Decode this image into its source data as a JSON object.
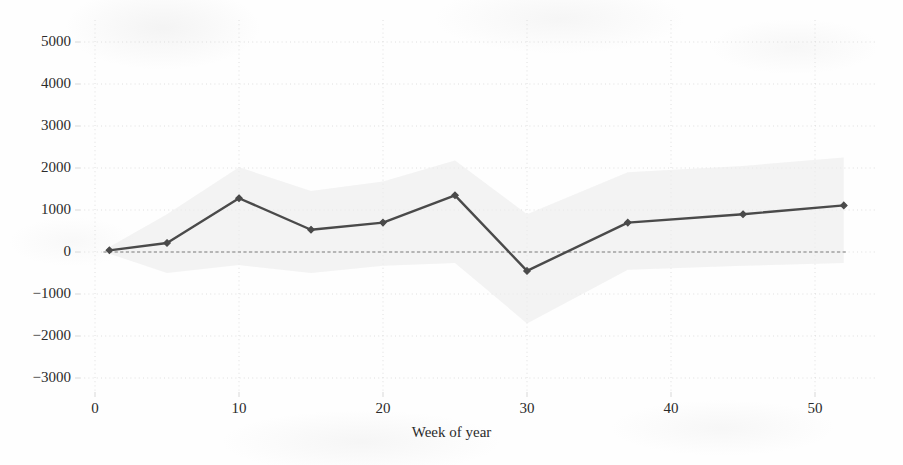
{
  "figure": {
    "background_color": "#fefefe",
    "ink_color": "#2b2b2b",
    "line_color": "#4a4a4a",
    "band_color": "#ededed",
    "grid_color": "#d8d8d8",
    "zero_line_color": "#7a7a7a"
  },
  "chart_data": {
    "type": "line",
    "title": "",
    "subtitle": "",
    "xlabel": "Week of year",
    "ylabel": "",
    "xlim": [
      -1.5,
      56
    ],
    "ylim": [
      -3600,
      5500
    ],
    "xticks": [
      0,
      10,
      20,
      30,
      40,
      50
    ],
    "xtick_labels": [
      "0",
      "10",
      "20",
      "30",
      "40",
      "50"
    ],
    "yticks": [
      5000,
      4000,
      3000,
      2000,
      1000,
      0,
      -1000,
      -2000,
      -3000
    ],
    "ytick_labels": [
      "5000",
      "4000",
      "3000",
      "2000",
      "1000",
      "0",
      "−1000",
      "−2000",
      "−3000"
    ],
    "grid": true,
    "grid_style": "dotted",
    "legend": false,
    "legend_position": "none",
    "zero_reference_line": {
      "y": 0,
      "style": "dashed",
      "label": ""
    },
    "x": [
      1,
      5,
      10,
      15,
      20,
      25,
      30,
      37,
      45,
      52
    ],
    "series": [
      {
        "name": "estimate",
        "marker": "diamond",
        "values": [
          40,
          215,
          1280,
          530,
          700,
          1350,
          -450,
          700,
          900,
          1110
        ]
      }
    ],
    "confidence_band": {
      "name": "confidence interval",
      "x": [
        1,
        5,
        10,
        15,
        20,
        25,
        30,
        37,
        45,
        52
      ],
      "upper": [
        120,
        900,
        2020,
        1450,
        1680,
        2180,
        900,
        1900,
        2050,
        2250
      ],
      "lower": [
        -40,
        -500,
        -310,
        -500,
        -330,
        -260,
        -1700,
        -420,
        -330,
        -260
      ]
    }
  }
}
